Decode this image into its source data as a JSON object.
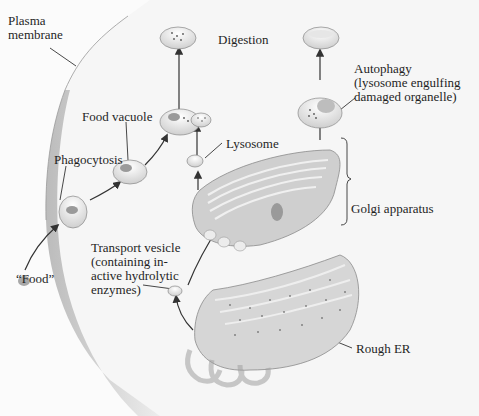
{
  "diagram": {
    "labels": {
      "plasma_membrane": "Plasma\nmembrane",
      "digestion": "Digestion",
      "autophagy": "Autophagy\n(lysosome engulfing\ndamaged organelle)",
      "food_vacuole": "Food vacuole",
      "lysosome": "Lysosome",
      "phagocytosis": "Phagocytosis",
      "golgi_apparatus": "Golgi apparatus",
      "transport_vesicle": "Transport vesicle\n(containing in-\nactive hydrolytic\nenzymes)",
      "food": "“Food”",
      "rough_er": "Rough ER"
    },
    "colors": {
      "cytoplasm": "#f7f7f7",
      "membrane_shade": "#bdbdbd",
      "organelle_fill": "#d9d9d9",
      "organelle_dark": "#a9a9a9",
      "vesicle_fill": "#f2f2f2",
      "food_particle": "#9a9a9a",
      "arrow": "#333333",
      "text": "#1f1f1f"
    }
  }
}
